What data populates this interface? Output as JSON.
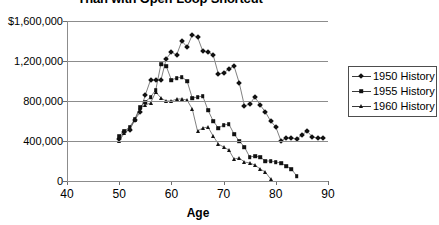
{
  "chart_data": {
    "type": "line",
    "title": "Than with Open-Loop Shortcut",
    "title_note": "clipped-at-top-edge",
    "xlabel": "Age",
    "ylabel": "",
    "xlim": [
      40,
      90
    ],
    "ylim": [
      0,
      1600000
    ],
    "xticks": [
      40,
      50,
      60,
      70,
      80,
      90
    ],
    "xtick_labels": [
      "40",
      "50",
      "60",
      "70",
      "80",
      "90"
    ],
    "yticks": [
      0,
      400000,
      800000,
      1200000,
      1600000
    ],
    "ytick_labels": [
      "0",
      "400,000",
      "800,000",
      "1,200,000",
      "$1,600,000"
    ],
    "grid": true,
    "grid_axis": "y",
    "legend_position": "right-outside",
    "series": [
      {
        "name": "1950 History",
        "marker": "diamond",
        "color": "#111111",
        "x": [
          50,
          51,
          52,
          53,
          54,
          55,
          56,
          57,
          58,
          59,
          60,
          61,
          62,
          63,
          64,
          65,
          66,
          67,
          68,
          69,
          70,
          71,
          72,
          73,
          74,
          75,
          76,
          77,
          78,
          79,
          80,
          81,
          82,
          83,
          84,
          85,
          86,
          87,
          88,
          89
        ],
        "values": [
          420000,
          490000,
          510000,
          610000,
          690000,
          860000,
          1010000,
          1010000,
          1010000,
          1220000,
          1290000,
          1260000,
          1400000,
          1340000,
          1460000,
          1440000,
          1300000,
          1290000,
          1260000,
          1070000,
          1080000,
          1120000,
          1150000,
          980000,
          750000,
          770000,
          840000,
          760000,
          690000,
          600000,
          540000,
          400000,
          430000,
          430000,
          420000,
          460000,
          500000,
          440000,
          430000,
          430000
        ]
      },
      {
        "name": "1955 History",
        "marker": "square",
        "color": "#111111",
        "x": [
          50,
          51,
          52,
          53,
          54,
          55,
          56,
          57,
          58,
          59,
          60,
          61,
          62,
          63,
          64,
          65,
          66,
          67,
          68,
          69,
          70,
          71,
          72,
          73,
          74,
          75,
          76,
          77,
          78,
          79,
          80,
          81,
          82,
          83,
          84
        ],
        "values": [
          450000,
          500000,
          540000,
          620000,
          740000,
          790000,
          840000,
          910000,
          1170000,
          1150000,
          1010000,
          1030000,
          1040000,
          1000000,
          830000,
          840000,
          850000,
          710000,
          600000,
          530000,
          560000,
          570000,
          470000,
          400000,
          340000,
          240000,
          250000,
          240000,
          200000,
          200000,
          190000,
          180000,
          150000,
          120000,
          50000
        ]
      },
      {
        "name": "1960 History",
        "marker": "triangle",
        "color": "#111111",
        "x": [
          50,
          51,
          52,
          53,
          54,
          55,
          56,
          57,
          58,
          59,
          60,
          61,
          62,
          63,
          64,
          65,
          66,
          67,
          68,
          69,
          70,
          71,
          72,
          73,
          74,
          75,
          76,
          77,
          78,
          79
        ],
        "values": [
          400000,
          480000,
          530000,
          610000,
          730000,
          760000,
          780000,
          890000,
          830000,
          800000,
          800000,
          820000,
          820000,
          810000,
          720000,
          500000,
          530000,
          540000,
          450000,
          370000,
          340000,
          310000,
          220000,
          230000,
          190000,
          180000,
          160000,
          120000,
          90000,
          20000
        ]
      }
    ]
  },
  "legend": {
    "items": [
      {
        "label": "1950 History",
        "marker": "diamond"
      },
      {
        "label": "1955 History",
        "marker": "square"
      },
      {
        "label": "1960 History",
        "marker": "triangle"
      }
    ]
  }
}
